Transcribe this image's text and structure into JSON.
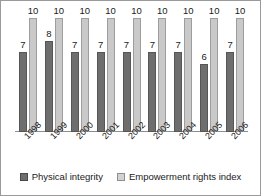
{
  "chart_data": {
    "type": "bar",
    "title": "",
    "subtitle": "",
    "xlabel": "",
    "ylabel": "",
    "ylim": [
      0,
      11
    ],
    "grid": false,
    "legend_position": "bottom-center",
    "categories": [
      "1998",
      "1999",
      "2000",
      "2001",
      "2002",
      "2003",
      "2004",
      "2005",
      "2006"
    ],
    "series": [
      {
        "name": "Physical integrity",
        "color": "#6e6e6e",
        "values": [
          7,
          8,
          7,
          7,
          7,
          7,
          7,
          6,
          7
        ]
      },
      {
        "name": "Empowerment rights index",
        "color": "#c9c9c9",
        "values": [
          10,
          10,
          10,
          10,
          10,
          10,
          10,
          10,
          10
        ]
      }
    ],
    "data_labels_shown": true,
    "axis_line_color": "#8d8d8d",
    "background_color": "#ffffff",
    "border_color": "#9a9a9a"
  },
  "legend": {
    "items": [
      {
        "label": "Physical integrity",
        "swatch": "dark-gray-square-icon"
      },
      {
        "label": "Empowerment rights index",
        "swatch": "light-gray-square-icon"
      }
    ]
  }
}
